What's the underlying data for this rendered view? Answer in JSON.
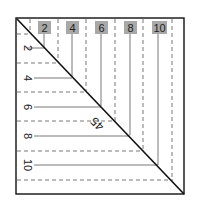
{
  "diagram": {
    "top_labels": [
      "2",
      "4",
      "6",
      "8",
      "10"
    ],
    "side_labels": [
      "2",
      "4",
      "6",
      "8",
      "10"
    ],
    "diagonal_label": "45",
    "colors": {
      "frame": "#111111",
      "label_bg": "#a8a8a8",
      "line": "#444444",
      "background": "#ffffff"
    }
  }
}
